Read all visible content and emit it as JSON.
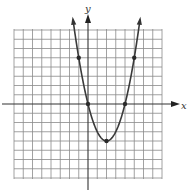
{
  "chart_data": {
    "type": "line",
    "title": "",
    "xlabel": "x",
    "ylabel": "y",
    "xlim": [
      -8,
      8
    ],
    "ylim": [
      -8,
      8
    ],
    "grid": true,
    "grid_step": 1,
    "series": [
      {
        "name": "parabola",
        "equation": "y = x^2 - 4x",
        "x": [
          -1.5,
          -1,
          0,
          1,
          2,
          3,
          4,
          5,
          5.5
        ],
        "values": [
          8.25,
          5,
          0,
          -3,
          -4,
          -3,
          0,
          5,
          8.25
        ],
        "arrows": "both-ends-up"
      }
    ],
    "marked_points": [
      {
        "x": -1,
        "y": 5
      },
      {
        "x": 0,
        "y": 0
      },
      {
        "x": 2,
        "y": -4
      },
      {
        "x": 4,
        "y": 0
      },
      {
        "x": 5,
        "y": 5
      }
    ]
  }
}
